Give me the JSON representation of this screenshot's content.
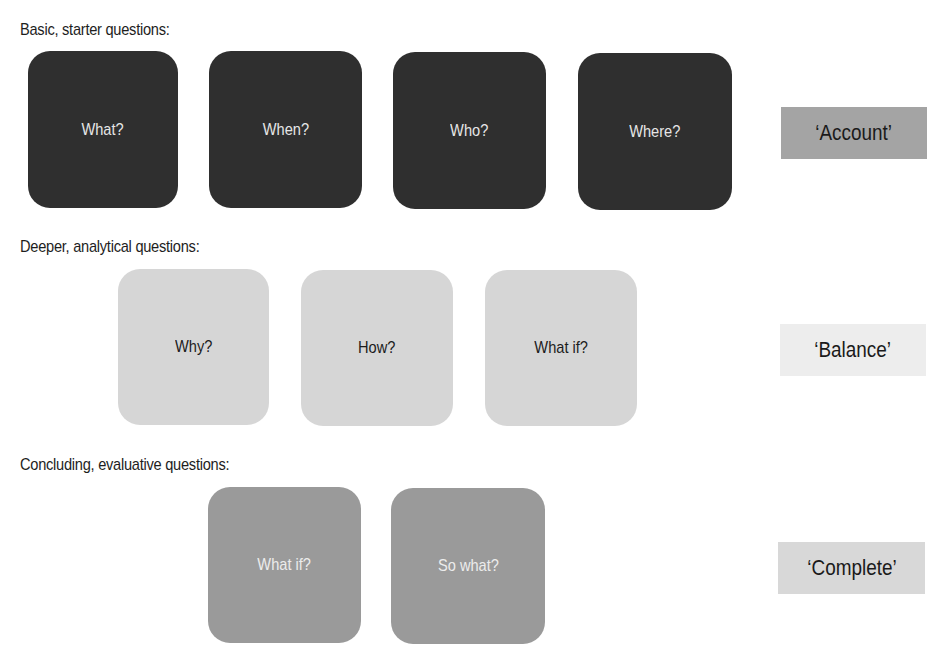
{
  "rows": [
    {
      "heading": "Basic, starter questions:",
      "questions": [
        "What?",
        "When?",
        "Who?",
        "Where?"
      ],
      "tag": "‘Account’",
      "box_color": "#2f2f2f",
      "text_color": "#e6e6e6",
      "tag_color": "#a4a4a4"
    },
    {
      "heading": "Deeper, analytical questions:",
      "questions": [
        "Why?",
        "How?",
        "What if?"
      ],
      "tag": "‘Balance’",
      "box_color": "#d6d6d6",
      "text_color": "#1c1c1c",
      "tag_color": "#ededed"
    },
    {
      "heading": "Concluding, evaluative questions:",
      "questions": [
        "What if?",
        "So what?"
      ],
      "tag": "‘Complete’",
      "box_color": "#9a9a9a",
      "text_color": "#ececec",
      "tag_color": "#d8d8d8"
    }
  ]
}
